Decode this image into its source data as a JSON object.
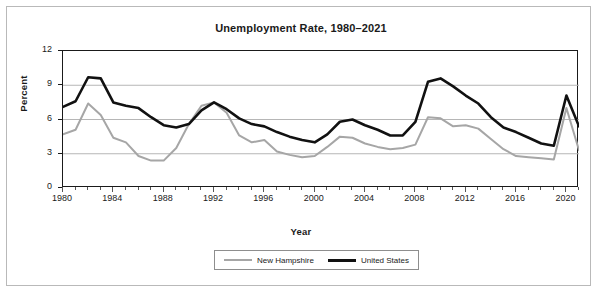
{
  "chart_data": {
    "type": "line",
    "title": "Unemployment Rate, 1980–2021",
    "xlabel": "Year",
    "ylabel": "Percent",
    "xlim": [
      1980,
      2021
    ],
    "ylim": [
      0,
      12
    ],
    "yticks": [
      "0",
      "3",
      "6",
      "9",
      "12"
    ],
    "ytick_values": [
      0,
      3,
      6,
      9,
      12
    ],
    "xticks": [
      "1980",
      "1984",
      "1988",
      "1992",
      "1996",
      "2000",
      "2004",
      "2008",
      "2012",
      "2016",
      "2020"
    ],
    "xtick_values": [
      1980,
      1984,
      1988,
      1992,
      1996,
      2000,
      2004,
      2008,
      2012,
      2016,
      2020
    ],
    "grid": "horizontal",
    "legend_position": "bottom",
    "x": [
      1980,
      1981,
      1982,
      1983,
      1984,
      1985,
      1986,
      1987,
      1988,
      1989,
      1990,
      1991,
      1992,
      1993,
      1994,
      1995,
      1996,
      1997,
      1998,
      1999,
      2000,
      2001,
      2002,
      2003,
      2004,
      2005,
      2006,
      2007,
      2008,
      2009,
      2010,
      2011,
      2012,
      2013,
      2014,
      2015,
      2016,
      2017,
      2018,
      2019,
      2020,
      2021
    ],
    "series": [
      {
        "name": "New Hampshire",
        "color": "#a6a6a6",
        "width": 2,
        "values": [
          4.7,
          5.1,
          7.4,
          6.4,
          4.4,
          4.0,
          2.8,
          2.4,
          2.4,
          3.5,
          5.6,
          7.2,
          7.5,
          6.6,
          4.6,
          4.0,
          4.2,
          3.2,
          2.9,
          2.7,
          2.8,
          3.6,
          4.5,
          4.4,
          3.9,
          3.6,
          3.4,
          3.5,
          3.8,
          6.2,
          6.1,
          5.4,
          5.5,
          5.2,
          4.3,
          3.4,
          2.8,
          2.7,
          2.6,
          2.5,
          7.0,
          3.3
        ]
      },
      {
        "name": "United States",
        "color": "#111111",
        "width": 2.6,
        "values": [
          7.1,
          7.6,
          9.7,
          9.6,
          7.5,
          7.2,
          7.0,
          6.2,
          5.5,
          5.3,
          5.6,
          6.8,
          7.5,
          6.9,
          6.1,
          5.6,
          5.4,
          4.9,
          4.5,
          4.2,
          4.0,
          4.7,
          5.8,
          6.0,
          5.5,
          5.1,
          4.6,
          4.6,
          5.8,
          9.3,
          9.6,
          8.9,
          8.1,
          7.4,
          6.2,
          5.3,
          4.9,
          4.4,
          3.9,
          3.7,
          8.1,
          5.4
        ]
      }
    ]
  },
  "legend": {
    "entries": [
      {
        "label": "New Hampshire"
      },
      {
        "label": "United States"
      }
    ]
  },
  "colors": {
    "new_hampshire": "#a6a6a6",
    "united_states": "#111111",
    "axis": "#1a1a1a",
    "gridline": "#b6b6b6",
    "frame": "#b9b9b9"
  }
}
